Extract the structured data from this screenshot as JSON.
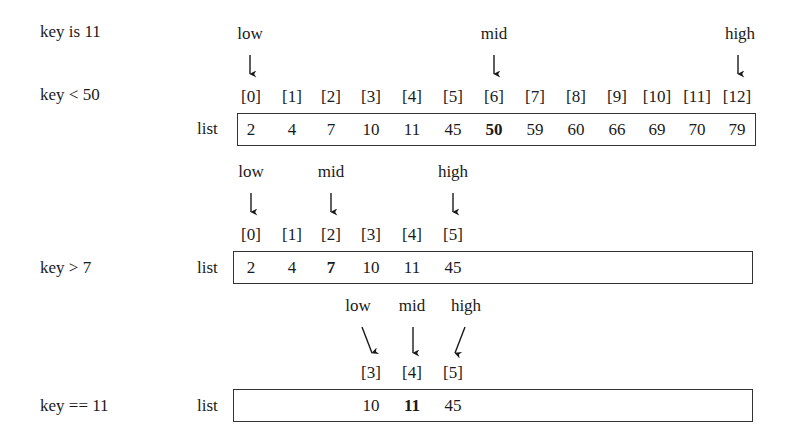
{
  "step1": {
    "key_note": "key is 11",
    "compare": "key < 50",
    "list_label": "list",
    "pointers": {
      "low": "low",
      "mid": "mid",
      "high": "high"
    },
    "indices": [
      "[0]",
      "[1]",
      "[2]",
      "[3]",
      "[4]",
      "[5]",
      "[6]",
      "[7]",
      "[8]",
      "[9]",
      "[10]",
      "[11]",
      "[12]"
    ],
    "values": [
      "2",
      "4",
      "7",
      "10",
      "11",
      "45",
      "50",
      "59",
      "60",
      "66",
      "69",
      "70",
      "79"
    ],
    "low_index": 0,
    "mid_index": 6,
    "high_index": 12
  },
  "step2": {
    "compare": "key > 7",
    "list_label": "list",
    "pointers": {
      "low": "low",
      "mid": "mid",
      "high": "high"
    },
    "indices": [
      "[0]",
      "[1]",
      "[2]",
      "[3]",
      "[4]",
      "[5]"
    ],
    "values": [
      "2",
      "4",
      "7",
      "10",
      "11",
      "45"
    ],
    "low_index": 0,
    "mid_index": 2,
    "high_index": 5
  },
  "step3": {
    "compare": "key == 11",
    "list_label": "list",
    "pointers": {
      "low": "low",
      "mid": "mid",
      "high": "high"
    },
    "indices": [
      "[3]",
      "[4]",
      "[5]"
    ],
    "values": [
      "10",
      "11",
      "45"
    ],
    "low_index": 3,
    "mid_index": 4,
    "high_index": 5
  }
}
